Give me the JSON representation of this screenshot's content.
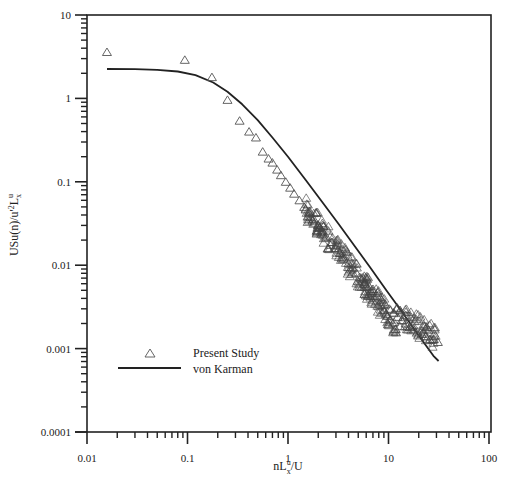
{
  "chart_data": {
    "type": "scatter",
    "title": "",
    "xlabel": "nL_x^u/U",
    "ylabel": "USu(n)/u'^2 L_x^u",
    "xscale": "log",
    "yscale": "log",
    "xlim": [
      0.01,
      100
    ],
    "ylim": [
      0.0001,
      10
    ],
    "x_tick_labels": [
      "0.01",
      "0.1",
      "1",
      "10",
      "100"
    ],
    "y_tick_labels": [
      "0.0001",
      "0.001",
      "0.01",
      "0.1",
      "1",
      "10"
    ],
    "grid": false,
    "legend_position": "lower left",
    "legend": [
      "Present Study",
      "von Karman"
    ],
    "series": [
      {
        "name": "Present Study",
        "marker": "open-triangle",
        "x": [
          0.0158,
          0.094,
          0.175,
          0.25,
          0.33,
          0.41,
          0.48,
          0.56,
          0.64,
          0.7,
          0.78,
          0.85,
          0.95,
          1.05,
          1.15,
          1.3,
          1.45,
          1.6,
          1.8,
          2.0,
          2.2,
          2.4,
          2.7,
          3.0,
          3.3,
          3.6,
          4.0,
          4.4,
          4.8,
          5.3,
          5.8,
          6.4,
          7.0,
          7.7,
          8.5,
          9.3,
          10.2,
          11.2,
          12.3,
          13.5,
          14.8,
          16.2,
          17.8,
          19.5,
          21.4,
          23.5,
          25.8,
          28.3,
          31.0
        ],
        "y": [
          3.6,
          2.9,
          1.8,
          0.96,
          0.54,
          0.4,
          0.34,
          0.23,
          0.19,
          0.17,
          0.14,
          0.12,
          0.1,
          0.085,
          0.072,
          0.06,
          0.05,
          0.043,
          0.036,
          0.03,
          0.026,
          0.022,
          0.019,
          0.016,
          0.014,
          0.012,
          0.0105,
          0.0093,
          0.0081,
          0.0071,
          0.0063,
          0.0056,
          0.0049,
          0.0043,
          0.0038,
          0.0034,
          0.003,
          0.0027,
          0.0024,
          0.0022,
          0.002,
          0.0018,
          0.0017,
          0.0016,
          0.0015,
          0.0014,
          0.0013,
          0.0013,
          0.0012
        ]
      },
      {
        "name": "von Karman",
        "line": "solid",
        "x": [
          0.0158,
          0.03,
          0.05,
          0.08,
          0.12,
          0.18,
          0.25,
          0.35,
          0.5,
          0.7,
          1.0,
          1.5,
          2.2,
          3.2,
          4.6,
          6.6,
          9.5,
          13.5,
          19.5,
          28.0,
          31.5
        ],
        "y": [
          2.25,
          2.24,
          2.2,
          2.1,
          1.9,
          1.55,
          1.2,
          0.85,
          0.55,
          0.34,
          0.2,
          0.105,
          0.057,
          0.031,
          0.017,
          0.0093,
          0.005,
          0.0028,
          0.0015,
          0.00082,
          0.00071
        ]
      }
    ]
  }
}
